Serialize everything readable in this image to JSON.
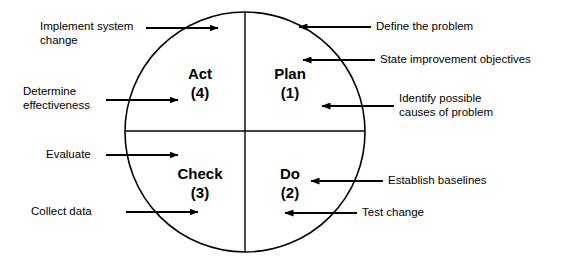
{
  "diagram": {
    "stroke_color": "#000000",
    "background_color": "#ffffff",
    "circle": {
      "center_x": 245,
      "center_y": 132,
      "radius": 120
    },
    "quadrants": [
      {
        "name": "act",
        "label": "Act",
        "number": "(4)",
        "text": "Act\n(4)",
        "cx": 200,
        "cy": 78
      },
      {
        "name": "plan",
        "label": "Plan",
        "number": "(1)",
        "text": "Plan\n(1)",
        "cx": 290,
        "cy": 78
      },
      {
        "name": "check",
        "label": "Check",
        "number": "(3)",
        "text": "Check\n(3)",
        "cx": 200,
        "cy": 178
      },
      {
        "name": "do",
        "label": "Do",
        "number": "(2)",
        "text": "Do\n(2)",
        "cx": 290,
        "cy": 178
      }
    ],
    "callouts_left": [
      {
        "name": "implement-system-change",
        "text": "Implement system\nchange",
        "quadrant": "act",
        "arrow_y": 28,
        "line_x1": 146,
        "line_x2": 218
      },
      {
        "name": "determine-effectiveness",
        "text": "Determine\neffectiveness",
        "quadrant": "act",
        "arrow_y": 100,
        "line_x1": 106,
        "line_x2": 178
      },
      {
        "name": "evaluate",
        "text": "Evaluate",
        "quadrant": "check",
        "arrow_y": 155,
        "line_x1": 106,
        "line_x2": 178
      },
      {
        "name": "collect-data",
        "text": "Collect data",
        "quadrant": "check",
        "arrow_y": 212,
        "line_x1": 126,
        "line_x2": 198
      }
    ],
    "callouts_right": [
      {
        "name": "define-the-problem",
        "text": "Define the problem",
        "quadrant": "plan",
        "arrow_y": 27,
        "line_x1": 299,
        "line_x2": 371
      },
      {
        "name": "state-improvement-objectives",
        "text": "State improvement objectives",
        "quadrant": "plan",
        "arrow_y": 60,
        "line_x1": 303,
        "line_x2": 375
      },
      {
        "name": "identify-possible-causes",
        "text": "Identify possible\ncauses of problem",
        "quadrant": "plan",
        "arrow_y": 106,
        "line_x1": 322,
        "line_x2": 394
      },
      {
        "name": "establish-baselines",
        "text": "Establish baselines",
        "quadrant": "do",
        "arrow_y": 181,
        "line_x1": 311,
        "line_x2": 383
      },
      {
        "name": "test-change",
        "text": "Test change",
        "quadrant": "do",
        "arrow_y": 213,
        "line_x1": 285,
        "line_x2": 357
      }
    ],
    "label_positions": {
      "implement_system_change": {
        "x": 40,
        "y": 20
      },
      "determine_effectiveness": {
        "x": 23,
        "y": 85
      },
      "evaluate": {
        "x": 46,
        "y": 148
      },
      "collect_data": {
        "x": 31,
        "y": 205
      },
      "define_the_problem": {
        "x": 376,
        "y": 20
      },
      "state_improvement": {
        "x": 380,
        "y": 53
      },
      "identify_possible": {
        "x": 399,
        "y": 92
      },
      "establish_baselines": {
        "x": 388,
        "y": 174
      },
      "test_change": {
        "x": 362,
        "y": 206
      }
    }
  }
}
